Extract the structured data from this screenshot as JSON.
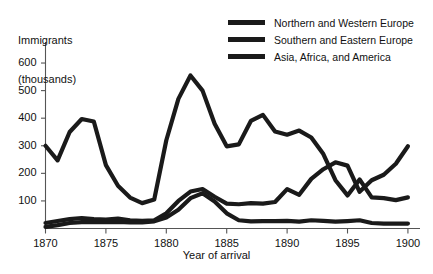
{
  "chart_data": {
    "type": "line",
    "title": "",
    "ylabel_line1": "Immigrants",
    "ylabel_line2": "(thousands)",
    "xlabel": "Year of arrival",
    "xlim": [
      1870,
      1901
    ],
    "ylim": [
      0,
      640
    ],
    "xticks": [
      1870,
      1875,
      1880,
      1885,
      1890,
      1895,
      1900
    ],
    "xtick_labels": [
      "1870",
      "1875",
      "1880",
      "1885",
      "1890",
      "1895",
      "1900"
    ],
    "yticks": [
      100,
      200,
      300,
      400,
      500,
      600
    ],
    "ytick_labels": [
      "100",
      "200",
      "300",
      "400",
      "500",
      "600"
    ],
    "grid": false,
    "legend_position": "top-right",
    "line_color": "#1a1a1a",
    "x": [
      1870,
      1871,
      1872,
      1873,
      1874,
      1875,
      1876,
      1877,
      1878,
      1879,
      1880,
      1881,
      1882,
      1883,
      1884,
      1885,
      1886,
      1887,
      1888,
      1889,
      1890,
      1891,
      1892,
      1893,
      1894,
      1895,
      1896,
      1897,
      1898,
      1899,
      1900
    ],
    "series": [
      {
        "name": "Northern and Western Europe",
        "values": [
          300,
          247,
          350,
          397,
          388,
          230,
          155,
          112,
          92,
          105,
          320,
          470,
          555,
          500,
          380,
          298,
          305,
          390,
          412,
          352,
          340,
          355,
          330,
          270,
          175,
          120,
          178,
          113,
          110,
          103,
          113
        ]
      },
      {
        "name": "Southern and Eastern Europe",
        "values": [
          20,
          27,
          34,
          38,
          34,
          32,
          36,
          30,
          28,
          30,
          55,
          100,
          134,
          143,
          115,
          90,
          88,
          92,
          90,
          96,
          143,
          122,
          180,
          215,
          240,
          228,
          133,
          175,
          195,
          235,
          298
        ]
      },
      {
        "name": "Asia, Africa, and America",
        "values": [
          6,
          12,
          20,
          23,
          24,
          23,
          24,
          22,
          22,
          26,
          40,
          68,
          110,
          128,
          98,
          55,
          30,
          26,
          27,
          27,
          28,
          25,
          30,
          28,
          25,
          27,
          30,
          20,
          18,
          18,
          18
        ]
      }
    ]
  },
  "legend": {
    "items": [
      {
        "label": "Northern and Western Europe"
      },
      {
        "label": "Southern and Eastern Europe"
      },
      {
        "label": "Asia, Africa, and America"
      }
    ]
  }
}
